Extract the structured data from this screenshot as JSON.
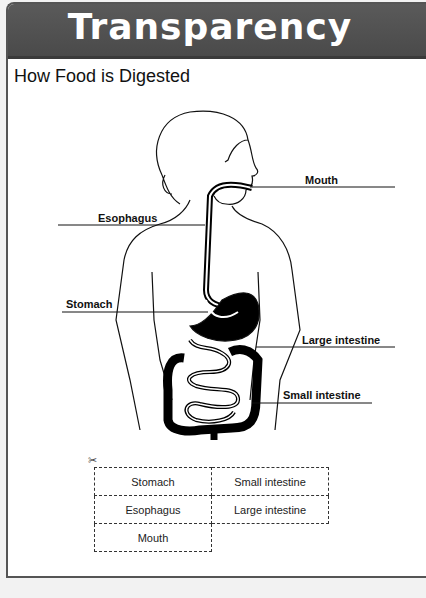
{
  "header": {
    "title": "Transparency"
  },
  "subtitle": "How Food is Digested",
  "labels": {
    "mouth": "Mouth",
    "esophagus": "Esophagus",
    "stomach": "Stomach",
    "large_intestine": "Large intestine",
    "small_intestine": "Small intestine"
  },
  "cutout": {
    "icon": "scissors-icon",
    "cards": [
      [
        "Stomach",
        "Small intestine"
      ],
      [
        "Esophagus",
        "Large intestine"
      ],
      [
        "Mouth",
        ""
      ]
    ]
  },
  "colors": {
    "banner": "#4f4f4f",
    "text": "#111111"
  }
}
